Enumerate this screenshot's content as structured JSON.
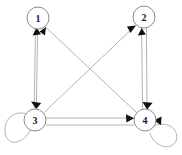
{
  "diagram": {
    "type": "directed-graph",
    "width": 182,
    "height": 155,
    "background_color": "#ffffff",
    "node_stroke_color": "#8c8c8c",
    "node_fill_color": "#ffffff",
    "edge_color": "#b4b4b4",
    "arrowhead_color": "#111111",
    "label_color": "#1a1a1a",
    "node_radius": 11,
    "nodes": [
      {
        "id": "1",
        "label": "1",
        "cx": 38,
        "cy": 18
      },
      {
        "id": "2",
        "label": "2",
        "cx": 144,
        "cy": 17
      },
      {
        "id": "3",
        "label": "3",
        "cx": 35,
        "cy": 120
      },
      {
        "id": "4",
        "label": "4",
        "cx": 145,
        "cy": 120
      }
    ],
    "edges": [
      {
        "from": "3",
        "to": "1",
        "kind": "straight",
        "note": "vertical left side, arrow into 1"
      },
      {
        "from": "1",
        "to": "3",
        "kind": "straight",
        "note": "vertical left side, arrow into 3"
      },
      {
        "from": "4",
        "to": "1",
        "kind": "diagonal",
        "note": "diagonal, arrow into 1"
      },
      {
        "from": "3",
        "to": "2",
        "kind": "diagonal",
        "note": "diagonal, arrow into 2"
      },
      {
        "from": "4",
        "to": "2",
        "kind": "straight",
        "note": "vertical right side, arrow into 2"
      },
      {
        "from": "2",
        "to": "4",
        "kind": "straight",
        "note": "vertical right side, arrow into 4"
      },
      {
        "from": "3",
        "to": "4",
        "kind": "straight",
        "note": "horizontal bottom, arrow into 4"
      },
      {
        "from": "4",
        "to": "3",
        "kind": "straight",
        "note": "horizontal bottom, arrow into 3"
      },
      {
        "from": "3",
        "to": "3",
        "kind": "self-loop",
        "note": "loop on left of node 3"
      },
      {
        "from": "4",
        "to": "4",
        "kind": "self-loop",
        "note": "loop on right of node 4"
      }
    ]
  }
}
